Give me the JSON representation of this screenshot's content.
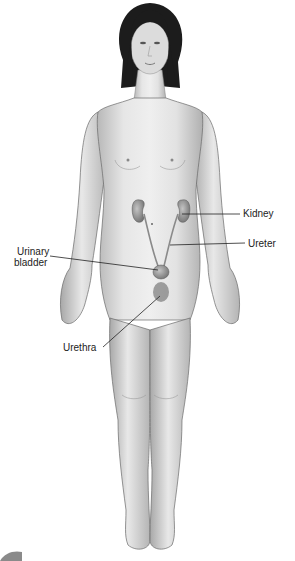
{
  "figure": {
    "labels": {
      "kidney": "Kidney",
      "ureter": "Ureter",
      "urinary_bladder_line1": "Urinary",
      "urinary_bladder_line2": "bladder",
      "urethra": "Urethra"
    },
    "colors": {
      "skin_light": "#e8e8e8",
      "skin_mid": "#c8c8c8",
      "skin_shadow": "#9a9a9a",
      "outline": "#6a6a6a",
      "hair": "#1a1a1a",
      "organ": "#8a8a8a",
      "leader_line": "#222222"
    }
  }
}
